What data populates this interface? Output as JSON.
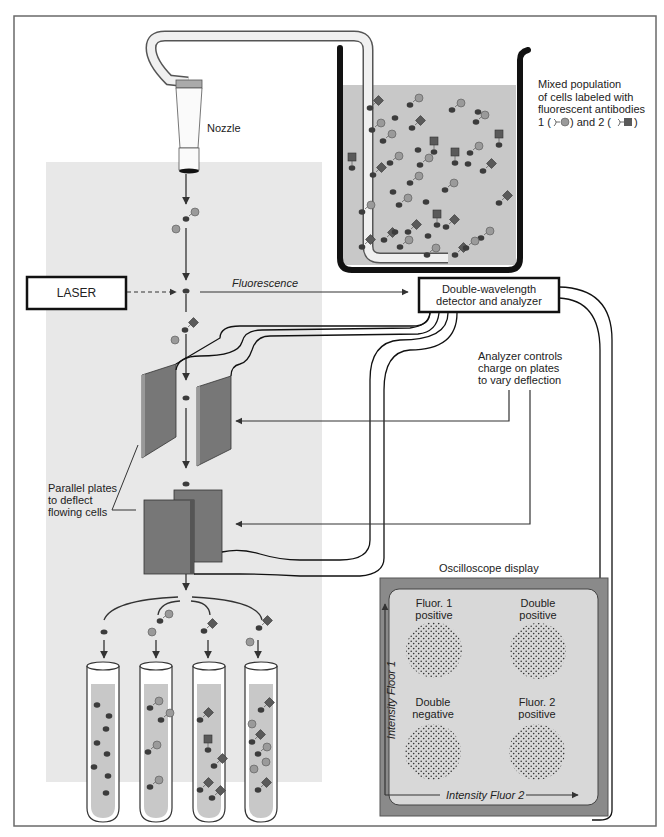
{
  "figure": {
    "colors": {
      "frame": "#6a6a6a",
      "panel_bg": "#e8e8e8",
      "liquid": "#c8c8c8",
      "cell_dark": "#3c3c3c",
      "antibody1_circle": "#9a9a9a",
      "antibody2_square": "#5a5a5a",
      "plate": "#7a7a7a",
      "scope_outer": "#8a8a8a",
      "scope_inner": "#d8d8d8",
      "line": "#333333"
    }
  },
  "labels": {
    "nozzle": "Nozzle",
    "mixed_population": "Mixed population\nof cells labeled with\nfluorescent antibodies",
    "legend_antibody1_prefix": "1 (",
    "legend_mid": ") and 2 (",
    "legend_suffix": ")",
    "laser": "LASER",
    "fluorescence": "Fluorescence",
    "detector": "Double-wavelength\ndetector and analyzer",
    "analyzer_controls": "Analyzer controls\ncharge on plates\nto vary deflection",
    "parallel_plates": "Parallel plates\nto deflect\nflowing cells",
    "oscilloscope_title": "Oscilloscope display"
  },
  "oscilloscope": {
    "y_axis": "Intensity Floor 1",
    "x_axis": "Intensity Fluor 2",
    "quadrants": [
      {
        "id": "top-left",
        "label": "Fluor. 1\npositive"
      },
      {
        "id": "top-right",
        "label": "Double\npositive"
      },
      {
        "id": "bottom-left",
        "label": "Double\nnegative"
      },
      {
        "id": "bottom-right",
        "label": "Fluor. 2\npositive"
      }
    ]
  },
  "tubes": [
    {
      "id": "tube-1",
      "contents": "unlabeled cells"
    },
    {
      "id": "tube-2",
      "contents": "antibody 1 labeled cells"
    },
    {
      "id": "tube-3",
      "contents": "antibody 2 labeled cells"
    },
    {
      "id": "tube-4",
      "contents": "double labeled cells"
    }
  ]
}
